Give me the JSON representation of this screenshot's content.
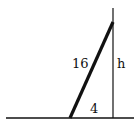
{
  "diagram": {
    "labels": {
      "hypotenuse": "16",
      "height": "h",
      "base": "4"
    },
    "top_partial_text": "ow.",
    "colors": {
      "stroke": "#111111",
      "background": "#ffffff"
    }
  }
}
